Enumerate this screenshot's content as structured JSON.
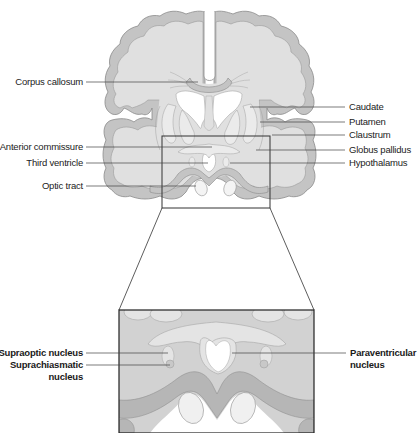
{
  "figure": {
    "colors": {
      "cortex": "#c4c4c4",
      "white_matter": "#e0e0e0",
      "nuclei": "#ebebeb",
      "outline": "#8a8a8a",
      "leader": "#444444",
      "box": "#333333"
    }
  },
  "upper_labels": {
    "left": [
      {
        "text": "Corpus callosum"
      },
      {
        "text": "Anterior commissure"
      },
      {
        "text": "Third ventricle"
      },
      {
        "text": "Optic tract"
      }
    ],
    "right": [
      {
        "text": "Caudate"
      },
      {
        "text": "Putamen"
      },
      {
        "text": "Claustrum"
      },
      {
        "text": "Globus pallidus"
      },
      {
        "text": "Hypothalamus"
      }
    ]
  },
  "inset_labels": {
    "left": [
      {
        "text": "Supraoptic nucleus"
      },
      {
        "text": "Suprachiasmatic"
      },
      {
        "text": "nucleus"
      }
    ],
    "right": [
      {
        "text": "Paraventricular"
      },
      {
        "text": "nucleus"
      }
    ]
  }
}
